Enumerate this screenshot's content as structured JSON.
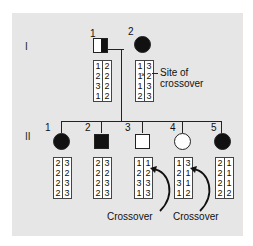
{
  "generations": [
    {
      "label": "I"
    },
    {
      "label": "II"
    }
  ],
  "gen1": [
    {
      "number": "1",
      "sex": "male",
      "status": "carrier-half-filled",
      "haplotypes": {
        "left": [
          "1",
          "2",
          "3",
          "1"
        ],
        "right": [
          "2",
          "2",
          "2",
          "2"
        ]
      }
    },
    {
      "number": "2",
      "sex": "female",
      "status": "affected",
      "haplotypes": {
        "left": [
          "1",
          "1",
          "1",
          "2"
        ],
        "right": [
          "3",
          "2",
          "3",
          "3"
        ]
      }
    }
  ],
  "gen2": [
    {
      "number": "1",
      "sex": "female",
      "status": "affected",
      "haplotypes": {
        "left": [
          "2",
          "2",
          "2",
          "2"
        ],
        "right": [
          "3",
          "2",
          "3",
          "3"
        ]
      }
    },
    {
      "number": "2",
      "sex": "male",
      "status": "affected",
      "haplotypes": {
        "left": [
          "2",
          "2",
          "2",
          "2"
        ],
        "right": [
          "3",
          "2",
          "3",
          "3"
        ]
      }
    },
    {
      "number": "3",
      "sex": "male",
      "status": "unaffected",
      "haplotypes": {
        "left": [
          "1",
          "2",
          "3",
          "1"
        ],
        "right": [
          "1",
          "2",
          "3",
          "3"
        ]
      }
    },
    {
      "number": "4",
      "sex": "female",
      "status": "unaffected",
      "haplotypes": {
        "left": [
          "1",
          "2",
          "3",
          "1"
        ],
        "right": [
          "3",
          "1",
          "1",
          "2"
        ]
      }
    },
    {
      "number": "5",
      "sex": "female",
      "status": "affected",
      "haplotypes": {
        "left": [
          "2",
          "2",
          "2",
          "2"
        ],
        "right": [
          "1",
          "1",
          "1",
          "2"
        ]
      }
    }
  ],
  "annotations": {
    "site_of_crossover_line1": "Site of",
    "site_of_crossover_line2": "crossover",
    "crossover_a": "Crossover",
    "crossover_b": "Crossover"
  },
  "colors": {
    "panel_bg": "#e6e6e6",
    "affected": "#111111",
    "unaffected": "#ffffff"
  }
}
